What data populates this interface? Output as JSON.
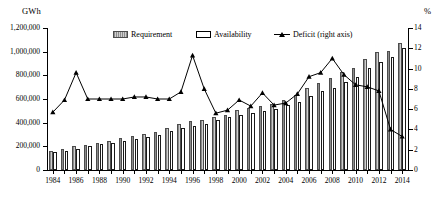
{
  "chart_data": {
    "type": "bar",
    "title": "",
    "xlabel": "",
    "ylabel": "GWh",
    "y2label": "%",
    "ylim": [
      0,
      1200000
    ],
    "y2lim": [
      0,
      14
    ],
    "ytick_labels": [
      "1,200,000",
      "1,000,000",
      "800,000",
      "600,000",
      "400,000",
      "200,000",
      "0"
    ],
    "ytick_values": [
      1200000,
      1000000,
      800000,
      600000,
      400000,
      200000,
      0
    ],
    "y2tick_labels": [
      "14",
      "12",
      "10",
      "8",
      "6",
      "4",
      "2",
      "0"
    ],
    "y2tick_values": [
      14,
      12,
      10,
      8,
      6,
      4,
      2,
      0
    ],
    "grid": false,
    "legend_position": "top-center",
    "categories": [
      "1984",
      "1985",
      "1986",
      "1987",
      "1988",
      "1989",
      "1990",
      "1991",
      "1992",
      "1993",
      "1994",
      "1995",
      "1996",
      "1997",
      "1998",
      "1999",
      "2000",
      "2001",
      "2002",
      "2003",
      "2004",
      "2005",
      "2006",
      "2007",
      "2008",
      "2009",
      "2010",
      "2011",
      "2012",
      "2013",
      "2014"
    ],
    "xtick_labels": [
      "1984",
      "1986",
      "1988",
      "1990",
      "1992",
      "1994",
      "1996",
      "1998",
      "2000",
      "2002",
      "2004",
      "2006",
      "2008",
      "2010",
      "2012",
      "2014"
    ],
    "series": [
      {
        "name": "Requirement",
        "axis": "left",
        "unit": "GWh",
        "values": [
          160000,
          175000,
          200000,
          215000,
          232000,
          245000,
          268000,
          288000,
          305000,
          323000,
          352000,
          385000,
          415000,
          425000,
          446000,
          468000,
          507000,
          522000,
          545000,
          560000,
          591000,
          631000,
          690000,
          739000,
          774000,
          830000,
          862000,
          937000,
          998000,
          1002000,
          1070000
        ]
      },
      {
        "name": "Availability",
        "axis": "left",
        "unit": "GWh",
        "values": [
          151000,
          163000,
          181000,
          200000,
          216000,
          228000,
          247000,
          266000,
          281000,
          300000,
          327000,
          354000,
          368000,
          390000,
          421000,
          444000,
          467000,
          483000,
          497000,
          519000,
          548000,
          578000,
          625000,
          666000,
          691000,
          747000,
          789000,
          858000,
          911000,
          959000,
          1035000
        ]
      },
      {
        "name": "Deficit (right axis)",
        "axis": "right",
        "unit": "%",
        "values": [
          5.7,
          6.9,
          9.6,
          7.0,
          7.0,
          7.0,
          7.0,
          7.2,
          7.2,
          7.0,
          7.0,
          7.7,
          11.3,
          8.0,
          5.6,
          5.9,
          6.9,
          6.3,
          7.6,
          6.4,
          6.6,
          7.5,
          9.2,
          9.6,
          11.0,
          9.4,
          8.4,
          8.2,
          7.8,
          4.0,
          3.3
        ]
      }
    ],
    "legend": [
      {
        "label": "Requirement",
        "marker": "bar-hatched"
      },
      {
        "label": "Availability",
        "marker": "bar-white"
      },
      {
        "label": "Deficit (right axis)",
        "marker": "line-triangle"
      }
    ],
    "colors": {
      "requirement": "#b3b3b3",
      "availability": "#ffffff",
      "deficit": "#000000",
      "axis": "#000000"
    }
  }
}
